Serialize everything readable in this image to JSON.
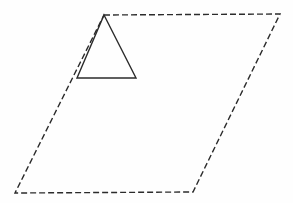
{
  "page": {
    "background_color": "#fefefe",
    "width": 293,
    "height": 203
  },
  "style": {
    "stroke_color": "#2b2b2b",
    "stroke_width": 1.4,
    "dash_pattern": "6 3"
  },
  "figure": {
    "caption": "",
    "shapes": [
      {
        "id": "parallelogram",
        "name": "parallelogram",
        "line_style": "dashed",
        "fill": "none",
        "stroke": "#2b2b2b",
        "vertices": [
          {
            "label": "top-left",
            "x": 104,
            "y": 15
          },
          {
            "label": "top-right",
            "x": 280,
            "y": 14
          },
          {
            "label": "bottom-right",
            "x": 193,
            "y": 192
          },
          {
            "label": "bottom-left",
            "x": 15,
            "y": 193
          }
        ],
        "points": "104,15 280,14 193,192 15,193"
      },
      {
        "id": "triangle",
        "name": "triangle",
        "line_style": "solid",
        "fill": "none",
        "stroke": "#2b2b2b",
        "vertices": [
          {
            "label": "apex",
            "x": 104,
            "y": 15
          },
          {
            "label": "base-right",
            "x": 136,
            "y": 78
          },
          {
            "label": "base-left",
            "x": 77,
            "y": 78
          }
        ],
        "points": "104,15 136,78 77,78"
      }
    ]
  }
}
